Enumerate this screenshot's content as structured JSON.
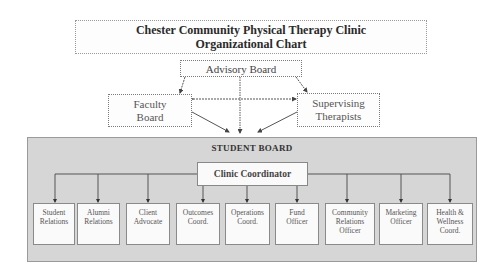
{
  "title": {
    "line1": "Chester Community Physical Therapy Clinic",
    "line2": "Organizational Chart"
  },
  "top_level": {
    "advisory_board": "Advisory Board",
    "faculty_board": {
      "line1": "Faculty",
      "line2": "Board"
    },
    "supervising_therapists": {
      "line1": "Supervising",
      "line2": "Therapists"
    }
  },
  "student_board": {
    "title": "STUDENT BOARD",
    "coordinator": "Clinic Coordinator",
    "roles": [
      {
        "line1": "Student",
        "line2": "Relations",
        "line3": ""
      },
      {
        "line1": "Alumni",
        "line2": "Relations",
        "line3": ""
      },
      {
        "line1": "Client",
        "line2": "Advocate",
        "line3": ""
      },
      {
        "line1": "Outcomes",
        "line2": "Coord.",
        "line3": ""
      },
      {
        "line1": "Operations",
        "line2": "Coord.",
        "line3": ""
      },
      {
        "line1": "Fund",
        "line2": "Officer",
        "line3": ""
      },
      {
        "line1": "Community",
        "line2": "Relations",
        "line3": "Officer"
      },
      {
        "line1": "Marketing",
        "line2": "Officer",
        "line3": ""
      },
      {
        "line1": "Health &",
        "line2": "Wellness",
        "line3": "Coord."
      }
    ]
  },
  "colors": {
    "board_fill": "#d6d6d6",
    "box_fill": "#fafafa",
    "line": "#555555"
  }
}
